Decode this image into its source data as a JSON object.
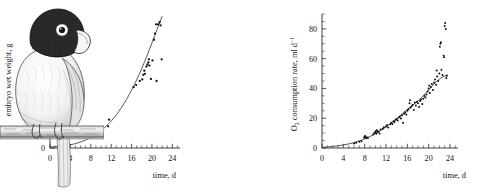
{
  "figure": {
    "kind": "two-panel-scatter-with-illustration",
    "illustration": {
      "name": "parrot-perched-on-branch",
      "description": "pen-and-ink stipple drawing of a dark-hooded parrot with white eye-ring and pale beak, perched on a horizontal branch, tail hanging down",
      "style": "black-and-white stipple engraving"
    }
  },
  "chart_data": [
    {
      "type": "scatter",
      "panel": "left",
      "title": "",
      "xlabel": "time, d",
      "ylabel": "embryo wet weight, g",
      "xlim": [
        0,
        25.5
      ],
      "ylim": [
        0,
        2.6
      ],
      "xticks": [
        0,
        4,
        8,
        12,
        16,
        20,
        24
      ],
      "yticks": [
        0,
        0.4,
        0.8,
        1.2,
        1.6,
        2,
        2.4
      ],
      "ytick_labels": [
        "0",
        "0.4",
        "0.8",
        "1.2",
        "1.6",
        "2",
        "2.4"
      ],
      "xtick_labels": [
        "0",
        "4",
        "8",
        "12",
        "16",
        "20",
        "24"
      ],
      "xminor_step": 1,
      "yminor_step": 0.2,
      "grid": false,
      "legend": "none",
      "fit_label": "fitted exponential growth curve",
      "series": [
        {
          "name": "embryo wet weight",
          "marker": "dot",
          "points": [
            [
              11.4,
              0.42
            ],
            [
              11.6,
              0.55
            ],
            [
              16.4,
              1.18
            ],
            [
              16.9,
              1.22
            ],
            [
              17.6,
              1.3
            ],
            [
              18.1,
              1.33
            ],
            [
              18.3,
              1.42
            ],
            [
              18.5,
              1.5
            ],
            [
              18.6,
              1.44
            ],
            [
              18.9,
              1.58
            ],
            [
              19.1,
              1.62
            ],
            [
              19.3,
              1.66
            ],
            [
              19.4,
              1.72
            ],
            [
              19.5,
              1.6
            ],
            [
              19.8,
              1.34
            ],
            [
              20.1,
              1.7
            ],
            [
              20.4,
              2.1
            ],
            [
              20.6,
              2.22
            ],
            [
              20.8,
              2.4
            ],
            [
              21.2,
              2.4
            ],
            [
              21.5,
              2.44
            ],
            [
              21.7,
              2.38
            ],
            [
              21.9,
              1.72
            ],
            [
              20.9,
              1.3
            ]
          ]
        }
      ],
      "fit_curve": {
        "form": "exponential",
        "points": [
          [
            0,
            0.02
          ],
          [
            2,
            0.03
          ],
          [
            4,
            0.06
          ],
          [
            6,
            0.11
          ],
          [
            8,
            0.2
          ],
          [
            10,
            0.33
          ],
          [
            11,
            0.42
          ],
          [
            12,
            0.52
          ],
          [
            13,
            0.64
          ],
          [
            14,
            0.78
          ],
          [
            15,
            0.94
          ],
          [
            16,
            1.12
          ],
          [
            17,
            1.32
          ],
          [
            18,
            1.54
          ],
          [
            19,
            1.78
          ],
          [
            20,
            2.04
          ],
          [
            21,
            2.3
          ],
          [
            22,
            2.56
          ]
        ]
      }
    },
    {
      "type": "scatter",
      "panel": "right",
      "title": "",
      "xlabel": "time, d",
      "ylabel": "O2 consumption rate, ml d-1",
      "ylabel_parts": {
        "base": "O",
        "sub": "2",
        "mid": " consumption rate, ml d",
        "sup": "−1"
      },
      "xlim": [
        0,
        25.5
      ],
      "ylim": [
        0,
        90
      ],
      "xticks": [
        0,
        4,
        8,
        12,
        16,
        20,
        24
      ],
      "yticks": [
        0,
        20,
        40,
        60,
        80
      ],
      "ytick_labels": [
        "0",
        "20",
        "40",
        "60",
        "80"
      ],
      "xtick_labels": [
        "0",
        "4",
        "8",
        "12",
        "16",
        "20",
        "24"
      ],
      "xminor_step": 1,
      "yminor_step": 5,
      "grid": false,
      "legend": "none",
      "fit_label": "fitted exponential curve",
      "series": [
        {
          "name": "O2 consumption rate",
          "marker": "dot",
          "points": [
            [
              6.0,
              3.0
            ],
            [
              6.4,
              3.5
            ],
            [
              7.0,
              4.2
            ],
            [
              7.4,
              4.6
            ],
            [
              7.9,
              7.0
            ],
            [
              8.0,
              7.5
            ],
            [
              8.1,
              8.0
            ],
            [
              8.2,
              6.5
            ],
            [
              8.4,
              7.2
            ],
            [
              8.6,
              6.8
            ],
            [
              9.6,
              9.0
            ],
            [
              9.8,
              10.0
            ],
            [
              10.0,
              10.5
            ],
            [
              10.1,
              11.5
            ],
            [
              10.2,
              9.5
            ],
            [
              10.3,
              12.0
            ],
            [
              10.4,
              10.8
            ],
            [
              10.6,
              11.0
            ],
            [
              10.8,
              9.8
            ],
            [
              11.0,
              12.5
            ],
            [
              11.4,
              13.0
            ],
            [
              11.6,
              14.0
            ],
            [
              12.0,
              14.5
            ],
            [
              12.2,
              15.5
            ],
            [
              12.4,
              13.8
            ],
            [
              12.8,
              16.0
            ],
            [
              13.0,
              17.0
            ],
            [
              13.2,
              16.2
            ],
            [
              13.4,
              18.0
            ],
            [
              13.6,
              17.5
            ],
            [
              13.8,
              19.0
            ],
            [
              14.0,
              19.5
            ],
            [
              14.2,
              18.5
            ],
            [
              14.4,
              20.5
            ],
            [
              14.6,
              21.0
            ],
            [
              14.8,
              19.8
            ],
            [
              15.0,
              22.0
            ],
            [
              15.2,
              17.0
            ],
            [
              15.4,
              23.0
            ],
            [
              15.6,
              24.0
            ],
            [
              15.8,
              22.5
            ],
            [
              16.0,
              25.0
            ],
            [
              16.2,
              26.0
            ],
            [
              16.4,
              30.0
            ],
            [
              16.5,
              32.0
            ],
            [
              16.6,
              27.0
            ],
            [
              16.8,
              28.0
            ],
            [
              17.0,
              29.0
            ],
            [
              17.2,
              25.5
            ],
            [
              17.4,
              30.5
            ],
            [
              17.6,
              28.5
            ],
            [
              17.8,
              31.0
            ],
            [
              18.0,
              30.0
            ],
            [
              18.2,
              27.5
            ],
            [
              18.4,
              31.5
            ],
            [
              18.6,
              32.5
            ],
            [
              18.8,
              29.5
            ],
            [
              19.0,
              33.0
            ],
            [
              19.2,
              35.0
            ],
            [
              19.4,
              34.0
            ],
            [
              19.6,
              36.0
            ],
            [
              19.8,
              38.0
            ],
            [
              20.0,
              40.0
            ],
            [
              20.1,
              42.0
            ],
            [
              20.2,
              37.0
            ],
            [
              20.4,
              41.0
            ],
            [
              20.6,
              43.0
            ],
            [
              20.8,
              39.0
            ],
            [
              21.0,
              44.0
            ],
            [
              21.2,
              46.0
            ],
            [
              21.4,
              42.5
            ],
            [
              21.5,
              52.0
            ],
            [
              21.6,
              48.0
            ],
            [
              21.8,
              45.0
            ],
            [
              22.0,
              50.0
            ],
            [
              22.1,
              68.0
            ],
            [
              22.2,
              70.0
            ],
            [
              22.3,
              71.0
            ],
            [
              22.4,
              52.5
            ],
            [
              22.6,
              49.0
            ],
            [
              22.8,
              62.0
            ],
            [
              22.9,
              61.0
            ],
            [
              23.0,
              82.0
            ],
            [
              23.1,
              84.0
            ],
            [
              23.2,
              80.0
            ],
            [
              23.3,
              47.0
            ],
            [
              23.4,
              48.5
            ]
          ]
        }
      ],
      "fit_curve": {
        "form": "exponential",
        "points": [
          [
            0,
            0.5
          ],
          [
            2,
            1.0
          ],
          [
            4,
            2.0
          ],
          [
            6,
            3.5
          ],
          [
            8,
            6.0
          ],
          [
            10,
            9.5
          ],
          [
            12,
            14.0
          ],
          [
            14,
            19.5
          ],
          [
            16,
            26.0
          ],
          [
            18,
            31.5
          ],
          [
            19,
            35.0
          ],
          [
            20,
            39.0
          ],
          [
            21,
            43.0
          ],
          [
            22,
            46.5
          ],
          [
            23,
            48.5
          ],
          [
            23.6,
            49.0
          ]
        ]
      }
    }
  ]
}
